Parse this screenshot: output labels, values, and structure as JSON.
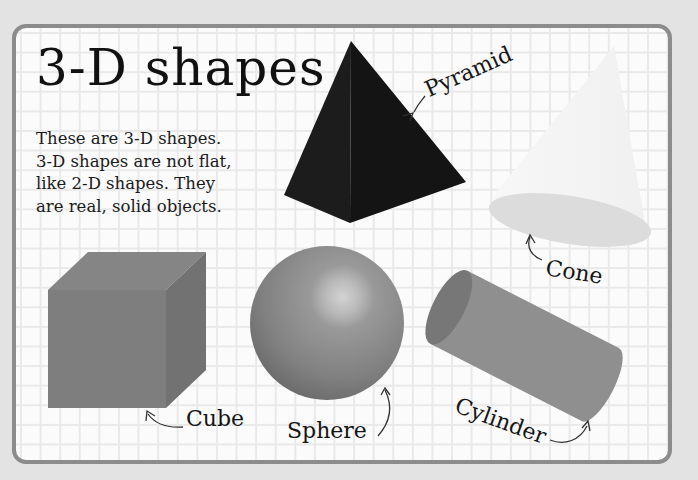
{
  "page": {
    "title": "3-D shapes",
    "intro_lines": [
      "These are 3-D shapes.",
      "3-D shapes are not flat,",
      "like 2-D shapes. They",
      "are real, solid objects."
    ]
  },
  "shapes": [
    {
      "name": "Pyramid",
      "label": "Pyramid",
      "color": "#151515"
    },
    {
      "name": "Cone",
      "label": "Cone",
      "color": "#f2f2f2"
    },
    {
      "name": "Cube",
      "label": "Cube",
      "color": "#7d7d7d"
    },
    {
      "name": "Sphere",
      "label": "Sphere",
      "color": "#8a8a8a"
    },
    {
      "name": "Cylinder",
      "label": "Cylinder",
      "color": "#8f8f8f"
    }
  ],
  "colors": {
    "page_background": "#e3e3e3",
    "card_border": "#8c8c8c",
    "grid_line": "#e9e9e9",
    "card_background": "#fbfbfb"
  }
}
